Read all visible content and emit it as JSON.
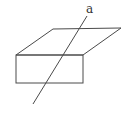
{
  "diagram": {
    "line_label": "a",
    "stroke_color": "#4a4a4a",
    "shapes": [
      "plane-parallelogram",
      "front-rectangle",
      "line-a"
    ]
  }
}
